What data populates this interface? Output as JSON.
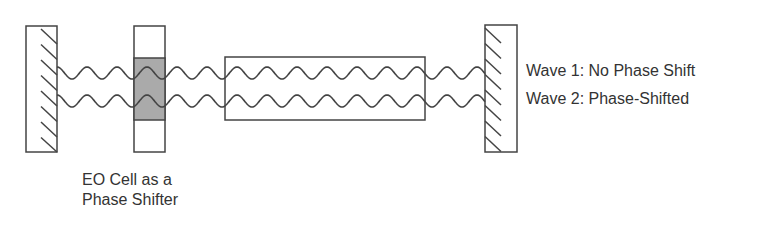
{
  "diagram": {
    "components": [
      {
        "id": "left-mirror",
        "type": "mirror"
      },
      {
        "id": "eo-cell",
        "type": "electro-optic cell",
        "label": "EO Cell as a Phase Shifter"
      },
      {
        "id": "gain-medium",
        "type": "rectangle"
      },
      {
        "id": "right-mirror",
        "type": "mirror"
      }
    ],
    "labels": {
      "wave1": "Wave 1: No Phase Shift",
      "wave2": "Wave 2: Phase-Shifted",
      "eo_line1": "EO Cell as a",
      "eo_line2": "Phase Shifter"
    },
    "colors": {
      "stroke": "#444444",
      "eo_shade": "#aaaaaa",
      "text": "#333333"
    }
  }
}
